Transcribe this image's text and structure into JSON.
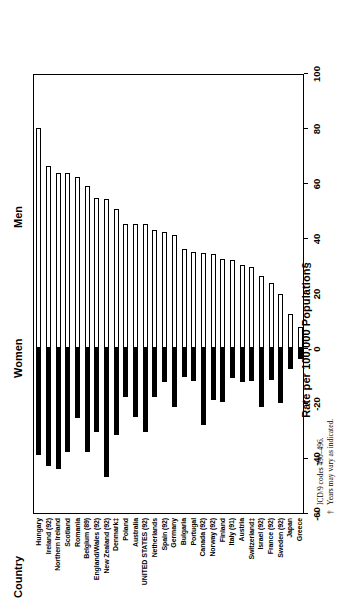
{
  "chart": {
    "type": "bar",
    "orientation": "horizontal-rotated",
    "country_axis_title": "Country",
    "value_axis_title": "Rate per 100,000 Population§",
    "group_men": "Men",
    "group_women": "Women"
  },
  "footnotes": [
    {
      "mark": "*",
      "text": "ICD/9 codes 490–496."
    },
    {
      "mark": "†",
      "text": "Years may vary as indicated."
    }
  ],
  "chart_data": {
    "type": "bar",
    "title": "",
    "subtitle": "",
    "xlabel": "Rate per 100,000 Population§",
    "ylabel": "Country",
    "xlim": [
      -60,
      100
    ],
    "xticks": [
      -60,
      -40,
      -20,
      0,
      20,
      40,
      60,
      80,
      100
    ],
    "xtick_labels": [
      "-60",
      "-40",
      "-20",
      "0",
      "20",
      "40",
      "60",
      "80",
      "100"
    ],
    "grid": false,
    "legend": [
      "Women",
      "Men"
    ],
    "legend_position": "above-plot",
    "categories": [
      "Hungary",
      "Ireland (92)",
      "Northern Ireland",
      "Scotland",
      "Romania",
      "Belgium (89)",
      "England/Wales (92)",
      "New Zealand (92)",
      "Denmark‡",
      "Poland",
      "Australia",
      "UNITED STATES (92)",
      "Netherlands",
      "Spain (92)",
      "Germany",
      "Bulgaria",
      "Portugal",
      "Canada (92)",
      "Norway (92)",
      "Finland",
      "Italy (91)",
      "Austria",
      "Switzerland‡",
      "Israel (92)",
      "France (92)",
      "Sweden (92)",
      "Japan",
      "Greece"
    ],
    "series": [
      {
        "name": "Men",
        "color": "#ffffff",
        "values": [
          80.0,
          66.0,
          63.5,
          63.5,
          62.0,
          59.0,
          54.5,
          54.0,
          50.5,
          45.0,
          45.0,
          45.0,
          43.0,
          42.0,
          41.0,
          36.0,
          35.0,
          34.5,
          34.0,
          32.5,
          32.0,
          30.0,
          29.5,
          26.0,
          23.5,
          19.5,
          12.5,
          7.5
        ]
      },
      {
        "name": "Women",
        "color": "#000000",
        "values": [
          -39.0,
          -43.0,
          -44.0,
          -38.0,
          -25.5,
          -38.0,
          -30.5,
          -47.0,
          -31.5,
          -18.0,
          -25.0,
          -30.5,
          -18.0,
          -12.5,
          -21.5,
          -10.5,
          -12.0,
          -28.0,
          -19.0,
          -19.5,
          -11.0,
          -12.5,
          -12.0,
          -21.5,
          -11.5,
          -20.0,
          -7.5,
          -4.0
        ]
      }
    ]
  }
}
